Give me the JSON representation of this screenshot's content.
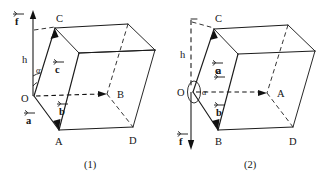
{
  "figure": {
    "background_color": "#ffffff",
    "line_color": "#1c1c1c"
  },
  "panels": [
    {
      "id": "panel-1",
      "caption": "(1)",
      "description": "Parallelepiped with origin O at lower-left-front, vertical force vector f pointing up, height h measured upward from O, angle alpha between vertical and vector c.",
      "axis": {
        "name": "vertical-axis",
        "direction": "up",
        "style": "solid-with-arrowhead"
      },
      "vectors": [
        {
          "name": "f",
          "label": "f",
          "direction": "up",
          "style": "solid"
        },
        {
          "name": "a",
          "label": "a",
          "direction": "down-right",
          "style": "solid",
          "from": "O",
          "to": "A"
        },
        {
          "name": "b",
          "label": "b",
          "direction": "right",
          "style": "dashed",
          "from": "O",
          "to": "B"
        },
        {
          "name": "c",
          "label": "c",
          "direction": "up-right",
          "style": "solid",
          "from": "O",
          "to": "C"
        }
      ],
      "scalars": [
        {
          "name": "h",
          "label": "h"
        },
        {
          "name": "alpha",
          "label": "α"
        }
      ],
      "vertices": [
        {
          "name": "O",
          "label": "O"
        },
        {
          "name": "A",
          "label": "A"
        },
        {
          "name": "B",
          "label": "B"
        },
        {
          "name": "C",
          "label": "C"
        },
        {
          "name": "D",
          "label": "D"
        }
      ]
    },
    {
      "id": "panel-2",
      "caption": "(2)",
      "description": "Parallelepiped with origin O at mid-left, vertical force vector f pointing down, height h measured upward above O along dashed line, angle alpha marked with an ellipse arc at O between vertical and vector a.",
      "axis": {
        "name": "vertical-axis",
        "direction": "down",
        "style": "dashed-above-solid-below-with-arrowhead"
      },
      "vectors": [
        {
          "name": "f",
          "label": "f",
          "direction": "down",
          "style": "solid"
        },
        {
          "name": "a",
          "label": "a",
          "direction": "right",
          "style": "dashed",
          "from": "O",
          "to": "A"
        },
        {
          "name": "b",
          "label": "b",
          "direction": "down-right",
          "style": "solid",
          "from": "O",
          "to": "B"
        },
        {
          "name": "c",
          "label": "c",
          "direction": "up-right",
          "style": "solid",
          "from": "O",
          "to": "C"
        }
      ],
      "scalars": [
        {
          "name": "h",
          "label": "h"
        },
        {
          "name": "alpha",
          "label": "α"
        }
      ],
      "vertices": [
        {
          "name": "O",
          "label": "O"
        },
        {
          "name": "A",
          "label": "A"
        },
        {
          "name": "B",
          "label": "B"
        },
        {
          "name": "C",
          "label": "C"
        },
        {
          "name": "D",
          "label": "D"
        }
      ]
    }
  ]
}
